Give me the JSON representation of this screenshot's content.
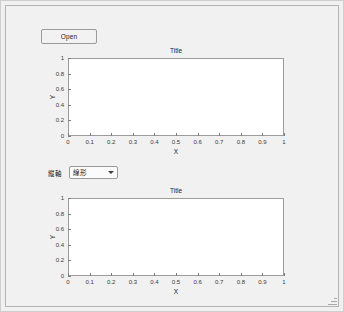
{
  "window": {
    "background_color": "#f1f1f1",
    "border_color": "#b4b4b4"
  },
  "toolbar": {
    "open_label": "Open"
  },
  "controls": {
    "axis_scale": {
      "label": "縦軸",
      "selected": "線形",
      "options": [
        "線形",
        "対数"
      ],
      "arrow_icon": "chevron-down-icon"
    }
  },
  "chart_data": [
    {
      "id": "top",
      "type": "line",
      "title": "Title",
      "xlabel": "X",
      "ylabel": "Y",
      "xlim": [
        0,
        1
      ],
      "ylim": [
        0,
        1
      ],
      "xticks": [
        "0",
        "0.1",
        "0.2",
        "0.3",
        "0.4",
        "0.5",
        "0.6",
        "0.7",
        "0.8",
        "0.9",
        "1"
      ],
      "yticks": [
        "0",
        "0.2",
        "0.4",
        "0.6",
        "0.8",
        "1"
      ],
      "grid": false,
      "legend": null,
      "series": [],
      "x": [],
      "values": []
    },
    {
      "id": "bottom",
      "type": "line",
      "title": "Title",
      "xlabel": "X",
      "ylabel": "Y",
      "xlim": [
        0,
        1
      ],
      "ylim": [
        0,
        1
      ],
      "xticks": [
        "0",
        "0.1",
        "0.2",
        "0.3",
        "0.4",
        "0.5",
        "0.6",
        "0.7",
        "0.8",
        "0.9",
        "1"
      ],
      "yticks": [
        "0",
        "0.2",
        "0.4",
        "0.6",
        "0.8",
        "1"
      ],
      "grid": false,
      "legend": null,
      "series": [],
      "x": [],
      "values": []
    }
  ]
}
